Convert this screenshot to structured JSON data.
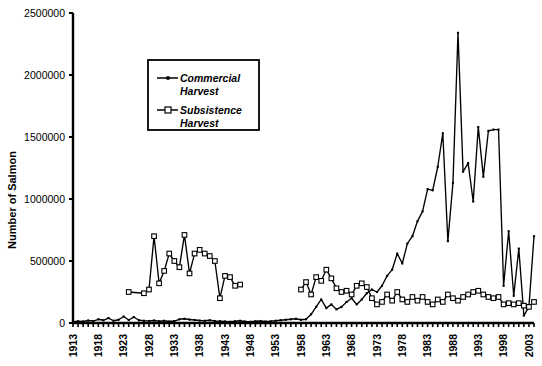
{
  "chart_data": {
    "type": "line",
    "title": "",
    "xlabel": "",
    "ylabel": "Number of Salmon",
    "xlim": [
      1913,
      2004
    ],
    "ylim": [
      0,
      2500000
    ],
    "ytick_labels": [
      "0",
      "500000",
      "1000000",
      "1500000",
      "2000000",
      "2500000"
    ],
    "ytick_values": [
      0,
      500000,
      1000000,
      1500000,
      2000000,
      2500000
    ],
    "xtick_labels": [
      "1913",
      "1918",
      "1923",
      "1928",
      "1933",
      "1938",
      "1943",
      "1948",
      "1953",
      "1958",
      "1963",
      "1968",
      "1973",
      "1978",
      "1983",
      "1988",
      "1993",
      "1998",
      "2003"
    ],
    "xtick_values": [
      1913,
      1918,
      1923,
      1928,
      1933,
      1938,
      1943,
      1948,
      1953,
      1958,
      1963,
      1968,
      1973,
      1978,
      1983,
      1988,
      1993,
      1998,
      2003
    ],
    "grid": false,
    "legend_position": "upper-left-inset",
    "series": [
      {
        "name": "Commercial Harvest",
        "marker": "filled-square",
        "color": "#000000",
        "points": [
          [
            1913,
            10000
          ],
          [
            1914,
            14000
          ],
          [
            1915,
            12000
          ],
          [
            1916,
            20000
          ],
          [
            1917,
            16000
          ],
          [
            1918,
            30000
          ],
          [
            1919,
            22000
          ],
          [
            1920,
            40000
          ],
          [
            1921,
            18000
          ],
          [
            1922,
            26000
          ],
          [
            1923,
            52000
          ],
          [
            1924,
            24000
          ],
          [
            1925,
            48000
          ],
          [
            1926,
            22000
          ],
          [
            1927,
            18000
          ],
          [
            1928,
            16000
          ],
          [
            1929,
            20000
          ],
          [
            1930,
            14000
          ],
          [
            1931,
            18000
          ],
          [
            1932,
            12000
          ],
          [
            1933,
            16000
          ],
          [
            1934,
            30000
          ],
          [
            1935,
            34000
          ],
          [
            1936,
            28000
          ],
          [
            1937,
            24000
          ],
          [
            1938,
            20000
          ],
          [
            1939,
            18000
          ],
          [
            1940,
            22000
          ],
          [
            1941,
            16000
          ],
          [
            1942,
            14000
          ],
          [
            1943,
            12000
          ],
          [
            1944,
            10000
          ],
          [
            1945,
            14000
          ],
          [
            1946,
            18000
          ],
          [
            1947,
            12000
          ],
          [
            1948,
            10000
          ],
          [
            1949,
            14000
          ],
          [
            1950,
            16000
          ],
          [
            1951,
            12000
          ],
          [
            1952,
            14000
          ],
          [
            1953,
            18000
          ],
          [
            1954,
            22000
          ],
          [
            1955,
            26000
          ],
          [
            1956,
            30000
          ],
          [
            1957,
            34000
          ],
          [
            1958,
            26000
          ],
          [
            1959,
            30000
          ],
          [
            1960,
            70000
          ],
          [
            1961,
            130000
          ],
          [
            1962,
            190000
          ],
          [
            1963,
            120000
          ],
          [
            1964,
            150000
          ],
          [
            1965,
            110000
          ],
          [
            1966,
            130000
          ],
          [
            1967,
            170000
          ],
          [
            1968,
            200000
          ],
          [
            1969,
            150000
          ],
          [
            1970,
            190000
          ],
          [
            1971,
            240000
          ],
          [
            1972,
            270000
          ],
          [
            1973,
            250000
          ],
          [
            1974,
            300000
          ],
          [
            1975,
            380000
          ],
          [
            1976,
            430000
          ],
          [
            1977,
            560000
          ],
          [
            1978,
            480000
          ],
          [
            1979,
            640000
          ],
          [
            1980,
            700000
          ],
          [
            1981,
            820000
          ],
          [
            1982,
            900000
          ],
          [
            1983,
            1080000
          ],
          [
            1984,
            1070000
          ],
          [
            1985,
            1260000
          ],
          [
            1986,
            1530000
          ],
          [
            1987,
            660000
          ],
          [
            1988,
            1130000
          ],
          [
            1989,
            2340000
          ],
          [
            1990,
            1220000
          ],
          [
            1991,
            1290000
          ],
          [
            1992,
            980000
          ],
          [
            1993,
            1580000
          ],
          [
            1994,
            1180000
          ],
          [
            1995,
            1550000
          ],
          [
            1996,
            1560000
          ],
          [
            1997,
            1560000
          ],
          [
            1998,
            300000
          ],
          [
            1999,
            740000
          ],
          [
            2000,
            220000
          ],
          [
            2001,
            600000
          ],
          [
            2002,
            60000
          ],
          [
            2003,
            130000
          ],
          [
            2004,
            700000
          ]
        ]
      },
      {
        "name": "Subsistence Harvest",
        "marker": "open-square",
        "color": "#000000",
        "points": [
          [
            1924,
            250000
          ],
          [
            1927,
            240000
          ],
          [
            1928,
            270000
          ],
          [
            1929,
            700000
          ],
          [
            1930,
            320000
          ],
          [
            1931,
            420000
          ],
          [
            1932,
            560000
          ],
          [
            1933,
            500000
          ],
          [
            1934,
            450000
          ],
          [
            1935,
            710000
          ],
          [
            1936,
            400000
          ],
          [
            1937,
            560000
          ],
          [
            1938,
            590000
          ],
          [
            1939,
            560000
          ],
          [
            1940,
            540000
          ],
          [
            1941,
            500000
          ],
          [
            1942,
            200000
          ],
          [
            1943,
            380000
          ],
          [
            1944,
            370000
          ],
          [
            1945,
            300000
          ],
          [
            1946,
            310000
          ],
          [
            1958,
            270000
          ],
          [
            1959,
            330000
          ],
          [
            1960,
            230000
          ],
          [
            1961,
            370000
          ],
          [
            1962,
            340000
          ],
          [
            1963,
            430000
          ],
          [
            1964,
            360000
          ],
          [
            1965,
            280000
          ],
          [
            1966,
            250000
          ],
          [
            1967,
            260000
          ],
          [
            1968,
            230000
          ],
          [
            1969,
            300000
          ],
          [
            1970,
            320000
          ],
          [
            1971,
            290000
          ],
          [
            1972,
            200000
          ],
          [
            1973,
            150000
          ],
          [
            1974,
            170000
          ],
          [
            1975,
            230000
          ],
          [
            1976,
            180000
          ],
          [
            1977,
            250000
          ],
          [
            1978,
            190000
          ],
          [
            1979,
            170000
          ],
          [
            1980,
            210000
          ],
          [
            1981,
            180000
          ],
          [
            1982,
            210000
          ],
          [
            1983,
            170000
          ],
          [
            1984,
            150000
          ],
          [
            1985,
            190000
          ],
          [
            1986,
            170000
          ],
          [
            1987,
            230000
          ],
          [
            1988,
            200000
          ],
          [
            1989,
            180000
          ],
          [
            1990,
            210000
          ],
          [
            1991,
            230000
          ],
          [
            1992,
            250000
          ],
          [
            1993,
            260000
          ],
          [
            1994,
            230000
          ],
          [
            1995,
            210000
          ],
          [
            1996,
            200000
          ],
          [
            1997,
            210000
          ],
          [
            1998,
            150000
          ],
          [
            1999,
            160000
          ],
          [
            2000,
            150000
          ],
          [
            2001,
            160000
          ],
          [
            2002,
            140000
          ],
          [
            2003,
            130000
          ],
          [
            2004,
            170000
          ]
        ]
      }
    ],
    "legend": [
      {
        "label_line1": "Commercial",
        "label_line2": "Harvest",
        "marker": "filled-square"
      },
      {
        "label_line1": "Subsistence",
        "label_line2": "Harvest",
        "marker": "open-square"
      }
    ]
  }
}
